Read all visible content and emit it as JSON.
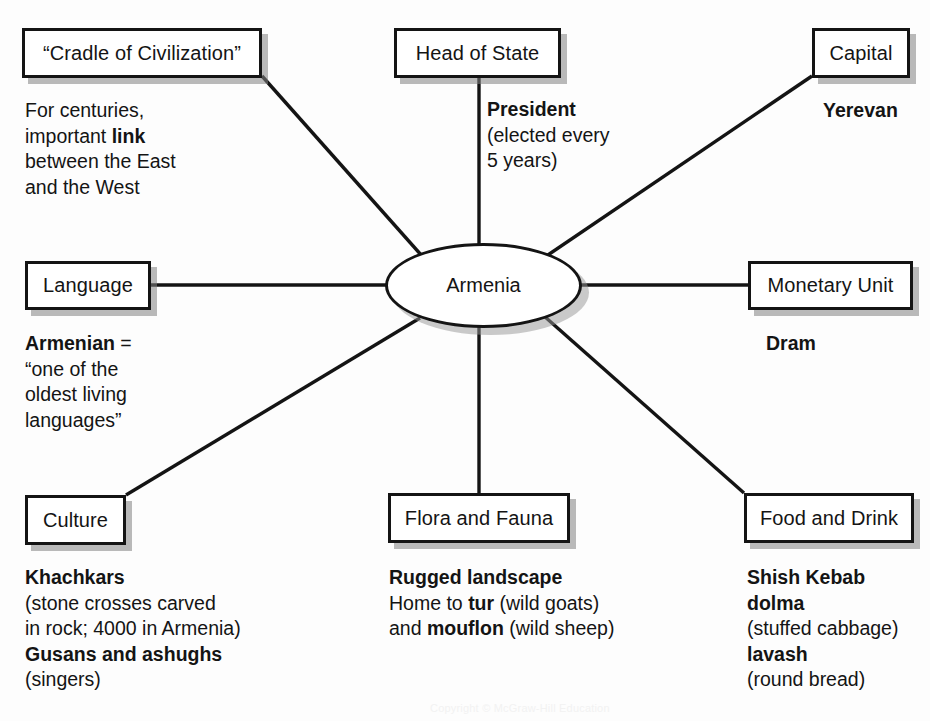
{
  "diagram": {
    "center": {
      "label": "Armenia"
    },
    "nodes": {
      "cradle": {
        "label": "“Cradle of Civilization”"
      },
      "head_of_state": {
        "label": "Head of State"
      },
      "capital": {
        "label": "Capital"
      },
      "language": {
        "label": "Language"
      },
      "monetary_unit": {
        "label": "Monetary Unit"
      },
      "culture": {
        "label": "Culture"
      },
      "flora_and_fauna": {
        "label": "Flora and Fauna"
      },
      "food_and_drink": {
        "label": "Food and Drink"
      }
    },
    "notes": {
      "cradle": {
        "line1": "For centuries,",
        "line2_pre": "important ",
        "line2_bold": "link",
        "line3": "between the East",
        "line4": "and the West"
      },
      "head_of_state": {
        "line1_bold": "President",
        "line2": "(elected every",
        "line3": "5 years)"
      },
      "capital": {
        "line1_bold": "Yerevan"
      },
      "language": {
        "line1_bold": "Armenian",
        "line1_post": " =",
        "line2": "“one of the",
        "line3": "oldest living",
        "line4": "languages”"
      },
      "monetary_unit": {
        "line1_bold": "Dram"
      },
      "culture": {
        "line1_bold": "Khachkars",
        "line2": "(stone crosses carved",
        "line3": "in rock; 4000 in Armenia)",
        "line4_bold": "Gusans and ashughs",
        "line5": "(singers)"
      },
      "flora_and_fauna": {
        "line1_bold": "Rugged landscape",
        "line2_pre": "Home to ",
        "line2_bold": "tur",
        "line2_post": " (wild goats)",
        "line3_pre": "and ",
        "line3_bold": "mouflon",
        "line3_post": " (wild sheep)"
      },
      "food_and_drink": {
        "line1_bold": "Shish Kebab",
        "line2_bold": "dolma",
        "line3": "(stuffed cabbage)",
        "line4_bold": "lavash",
        "line5": "(round bread)"
      }
    },
    "footer": {
      "credit": "Copyright © McGraw-Hill Education"
    },
    "colors": {
      "ink": "#141414",
      "paper": "#fdfdfd",
      "shadow": "#8a8a8a"
    }
  }
}
